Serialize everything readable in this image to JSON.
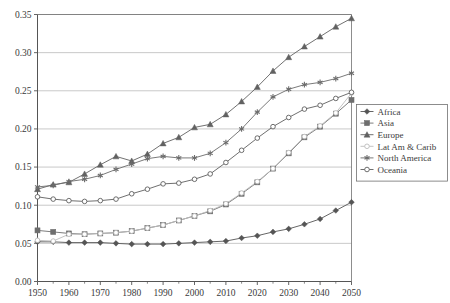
{
  "chart_data": {
    "type": "line",
    "title": "",
    "subtitle": "",
    "xlabel": "",
    "ylabel": "",
    "xlim": [
      1950,
      2050
    ],
    "ylim": [
      0.0,
      0.35
    ],
    "grid": true,
    "grid_axis": "y",
    "legend_position": "right",
    "x": [
      1950,
      1955,
      1960,
      1965,
      1970,
      1975,
      1980,
      1985,
      1990,
      1995,
      2000,
      2005,
      2010,
      2015,
      2020,
      2025,
      2030,
      2035,
      2040,
      2045,
      2050
    ],
    "xticks": [
      1950,
      1960,
      1970,
      1980,
      1990,
      2000,
      2010,
      2020,
      2030,
      2040,
      2050
    ],
    "xtick_labels": [
      "1950",
      "1960",
      "1970",
      "1980",
      "1990",
      "2000",
      "2010",
      "2020",
      "2030",
      "2040",
      "2050"
    ],
    "xminorticks": [
      1955,
      1965,
      1975,
      1985,
      1995,
      2005,
      2015,
      2025,
      2035,
      2045
    ],
    "yticks": [
      0.0,
      0.05,
      0.1,
      0.15,
      0.2,
      0.25,
      0.3,
      0.35
    ],
    "ytick_labels": [
      "0.00",
      "0.05",
      "0.10",
      "0.15",
      "0.20",
      "0.25",
      "0.30",
      "0.35"
    ],
    "series": [
      {
        "name": "Africa",
        "marker": "diamond",
        "color": "#555555",
        "values": [
          0.052,
          0.052,
          0.051,
          0.051,
          0.051,
          0.05,
          0.049,
          0.049,
          0.049,
          0.05,
          0.051,
          0.052,
          0.053,
          0.057,
          0.06,
          0.065,
          0.069,
          0.075,
          0.082,
          0.093,
          0.104
        ]
      },
      {
        "name": "Asia",
        "marker": "square",
        "color": "#6e6e6e",
        "values": [
          0.067,
          0.065,
          0.063,
          0.062,
          0.063,
          0.064,
          0.066,
          0.07,
          0.074,
          0.08,
          0.086,
          0.092,
          0.101,
          0.115,
          0.13,
          0.148,
          0.168,
          0.189,
          0.203,
          0.22,
          0.238
        ]
      },
      {
        "name": "Europe",
        "marker": "triangle",
        "color": "#616161",
        "values": [
          0.121,
          0.127,
          0.13,
          0.141,
          0.153,
          0.164,
          0.158,
          0.167,
          0.181,
          0.189,
          0.202,
          0.206,
          0.219,
          0.236,
          0.255,
          0.276,
          0.294,
          0.308,
          0.321,
          0.334,
          0.345
        ]
      },
      {
        "name": "Lat Am & Carib",
        "marker": "open-circle",
        "color": "#bcbcbc",
        "values": [
          0.054,
          0.053,
          0.062,
          0.062,
          0.063,
          0.064,
          0.066,
          0.07,
          0.074,
          0.08,
          0.086,
          0.093,
          0.102,
          0.116,
          0.131,
          0.148,
          0.169,
          0.19,
          0.204,
          0.221,
          0.247
        ]
      },
      {
        "name": "North America",
        "marker": "star",
        "color": "#6b6b6b",
        "values": [
          0.124,
          0.126,
          0.131,
          0.134,
          0.139,
          0.147,
          0.154,
          0.161,
          0.164,
          0.162,
          0.162,
          0.168,
          0.182,
          0.2,
          0.222,
          0.242,
          0.252,
          0.258,
          0.261,
          0.266,
          0.273
        ]
      },
      {
        "name": "Oceania",
        "marker": "open-circle",
        "color": "#5f5f5f",
        "values": [
          0.111,
          0.108,
          0.106,
          0.105,
          0.106,
          0.108,
          0.115,
          0.121,
          0.128,
          0.129,
          0.134,
          0.141,
          0.156,
          0.172,
          0.188,
          0.203,
          0.215,
          0.226,
          0.231,
          0.24,
          0.248
        ]
      }
    ]
  },
  "legend": {
    "items": [
      {
        "label": "Africa",
        "marker": "diamond-marker"
      },
      {
        "label": "Asia",
        "marker": "square-marker"
      },
      {
        "label": "Europe",
        "marker": "triangle-marker"
      },
      {
        "label": "Lat Am & Carib",
        "marker": "open-circle-marker"
      },
      {
        "label": "North America",
        "marker": "star-marker"
      },
      {
        "label": "Oceania",
        "marker": "open-circle-marker"
      }
    ]
  },
  "colors": {
    "axis": "#555555",
    "grid": "#b0b0b0",
    "frame": "#707070",
    "text": "#3a3a3a",
    "background": "#ffffff"
  }
}
